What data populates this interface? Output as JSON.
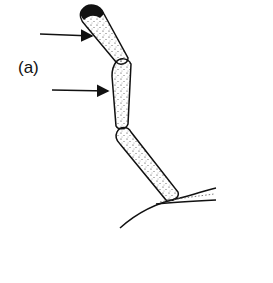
{
  "figure": {
    "panel_label": "(a)",
    "arrows": [
      {
        "name": "upper-arrow",
        "from": [
          40,
          34
        ],
        "to": [
          92,
          36
        ]
      },
      {
        "name": "lower-arrow",
        "from": [
          52,
          90
        ],
        "to": [
          108,
          91
        ]
      }
    ],
    "colors": {
      "ink": "#111111",
      "background": "#ffffff"
    }
  }
}
